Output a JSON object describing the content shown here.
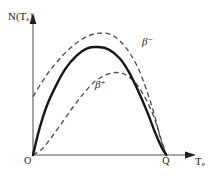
{
  "figure": {
    "background": "#ffffff",
    "axis_color": "#8c8c8c",
    "curve_color": "#1a1a1a",
    "dash_color": "#4d4d4d"
  },
  "axes": {
    "y_label": "N(T",
    "y_label_sub": "e",
    "y_label_close": ")",
    "x_label": "T",
    "x_label_sub": "e",
    "origin_label": "O",
    "endpoint_label": "Q"
  },
  "annotations": {
    "beta_minus_sym": "β",
    "beta_minus_sup": "−",
    "beta_plus_sym": "β",
    "beta_plus_sup": "+"
  },
  "chart_data": {
    "type": "line",
    "title": "",
    "xlabel": "T_e",
    "ylabel": "N(T_e)",
    "xlim": [
      0,
      1.0
    ],
    "ylim": [
      0,
      1.0
    ],
    "grid": false,
    "legend": "inline-annotations",
    "x_ticks": [
      "O",
      "Q"
    ],
    "x_tick_values": [
      0.0,
      0.86
    ],
    "y_ticks": [],
    "series": [
      {
        "name": "β−",
        "style": "dashed",
        "note": "Coulomb attraction enhances low-energy electrons; curve starts at finite value on the N axis",
        "x": [
          0.0,
          0.05,
          0.1,
          0.16,
          0.22,
          0.29,
          0.36,
          0.43,
          0.5,
          0.56,
          0.62,
          0.68,
          0.73,
          0.78,
          0.82,
          0.86
        ],
        "y": [
          0.46,
          0.56,
          0.65,
          0.74,
          0.82,
          0.89,
          0.94,
          0.96,
          0.95,
          0.9,
          0.81,
          0.68,
          0.52,
          0.33,
          0.14,
          0.0
        ]
      },
      {
        "name": "statistical",
        "style": "solid",
        "note": "Allowed (no Coulomb correction) beta spectrum shape",
        "x": [
          0.0,
          0.04,
          0.09,
          0.15,
          0.21,
          0.28,
          0.35,
          0.42,
          0.49,
          0.56,
          0.62,
          0.68,
          0.74,
          0.79,
          0.83,
          0.86
        ],
        "y": [
          0.0,
          0.2,
          0.39,
          0.55,
          0.68,
          0.78,
          0.84,
          0.85,
          0.83,
          0.76,
          0.65,
          0.5,
          0.33,
          0.17,
          0.06,
          0.0
        ]
      },
      {
        "name": "β+",
        "style": "dashed",
        "note": "Coulomb repulsion suppresses low-energy positrons; curve rises slowly from the origin",
        "x": [
          0.0,
          0.06,
          0.12,
          0.19,
          0.26,
          0.33,
          0.4,
          0.47,
          0.54,
          0.6,
          0.66,
          0.71,
          0.76,
          0.8,
          0.83,
          0.86
        ],
        "y": [
          0.0,
          0.05,
          0.14,
          0.26,
          0.38,
          0.49,
          0.58,
          0.63,
          0.65,
          0.63,
          0.57,
          0.48,
          0.36,
          0.23,
          0.11,
          0.0
        ]
      }
    ]
  }
}
